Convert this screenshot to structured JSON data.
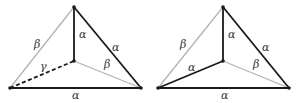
{
  "colors": {
    "dark": "#1a1a1a",
    "light": "#b3b3b3"
  },
  "diagrams": [
    {
      "name": "left",
      "vertices": {
        "top": [
          74,
          7
        ],
        "center": [
          74,
          61
        ],
        "left": [
          10,
          88
        ],
        "right": [
          141,
          88
        ]
      },
      "edges": [
        {
          "from": "left",
          "to": "top",
          "style": "light",
          "label": "β",
          "lx": 34,
          "ly": 48
        },
        {
          "from": "center",
          "to": "top",
          "style": "dark",
          "label": "α",
          "lx": 79,
          "ly": 38
        },
        {
          "from": "top",
          "to": "right",
          "style": "dark",
          "label": "α",
          "lx": 112,
          "ly": 51
        },
        {
          "from": "left",
          "to": "center",
          "style": "dashed",
          "label": "γ",
          "lx": 40,
          "ly": 70
        },
        {
          "from": "center",
          "to": "right",
          "style": "light",
          "label": "β",
          "lx": 104,
          "ly": 68
        },
        {
          "from": "left",
          "to": "right",
          "style": "dark",
          "label": "α",
          "lx": 72,
          "ly": 99
        }
      ]
    },
    {
      "name": "right",
      "vertices": {
        "top": [
          223,
          7
        ],
        "center": [
          223,
          61
        ],
        "left": [
          158,
          88
        ],
        "right": [
          289,
          88
        ]
      },
      "edges": [
        {
          "from": "left",
          "to": "top",
          "style": "light",
          "label": "β",
          "lx": 180,
          "ly": 48
        },
        {
          "from": "center",
          "to": "top",
          "style": "dark",
          "label": "α",
          "lx": 228,
          "ly": 38
        },
        {
          "from": "top",
          "to": "right",
          "style": "dark",
          "label": "α",
          "lx": 262,
          "ly": 51
        },
        {
          "from": "left",
          "to": "center",
          "style": "dark",
          "label": "α",
          "lx": 188,
          "ly": 71
        },
        {
          "from": "center",
          "to": "right",
          "style": "light",
          "label": "β",
          "lx": 253,
          "ly": 68
        },
        {
          "from": "left",
          "to": "right",
          "style": "dark",
          "label": "α",
          "lx": 221,
          "ly": 99
        }
      ]
    }
  ]
}
